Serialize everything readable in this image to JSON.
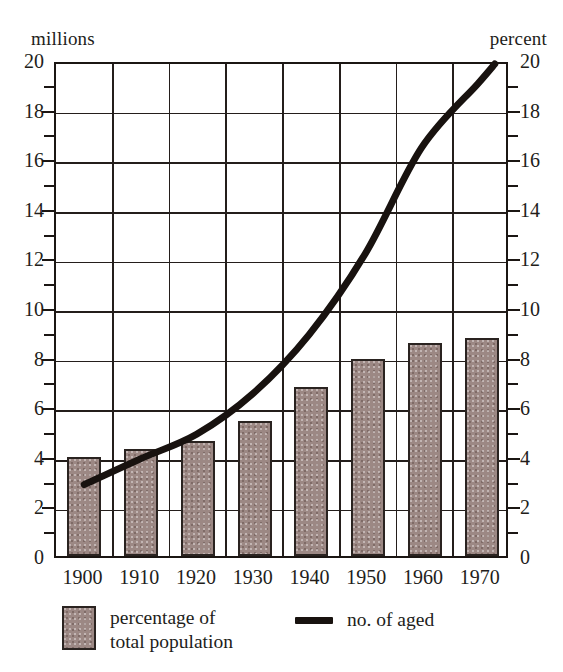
{
  "chart_data": {
    "type": "bar",
    "title": "",
    "subtitle": "",
    "xlabel": "",
    "ylabel_left": "millions",
    "ylabel_right": "percent",
    "categories": [
      "1900",
      "1910",
      "1920",
      "1930",
      "1940",
      "1950",
      "1960",
      "1970"
    ],
    "ylim": [
      0,
      20
    ],
    "ytick_step": 2,
    "yticks": [
      "0",
      "2",
      "4",
      "6",
      "8",
      "10",
      "12",
      "14",
      "16",
      "18",
      "20"
    ],
    "minor_ytick_step": 1,
    "grid": "on",
    "legend_position": "below-axis",
    "series": [
      {
        "name": "percentage of\ntotal population",
        "legend_label": "percentage of\ntotal population",
        "type": "bar",
        "axis": "right-percent",
        "color": "#9c8884",
        "edge_color": "#2a2320",
        "values": [
          4.0,
          4.3,
          4.65,
          5.45,
          6.8,
          7.95,
          8.6,
          8.8
        ]
      },
      {
        "name": "no. of aged",
        "legend_label": "no. of aged",
        "type": "line",
        "axis": "left-millions",
        "color": "#18120f",
        "line_width": 7,
        "x": [
          "1900",
          "1910",
          "1920",
          "1930",
          "1940",
          "1950",
          "1960",
          "1970",
          "1973"
        ],
        "values": [
          2.9,
          3.95,
          4.95,
          6.6,
          9.0,
          12.3,
          16.6,
          19.2,
          20.0
        ]
      }
    ]
  },
  "legend": {
    "bars_label": "percentage of\ntotal population",
    "line_label": "no. of aged"
  },
  "axes": {
    "left_caption": "millions",
    "right_caption": "percent"
  }
}
